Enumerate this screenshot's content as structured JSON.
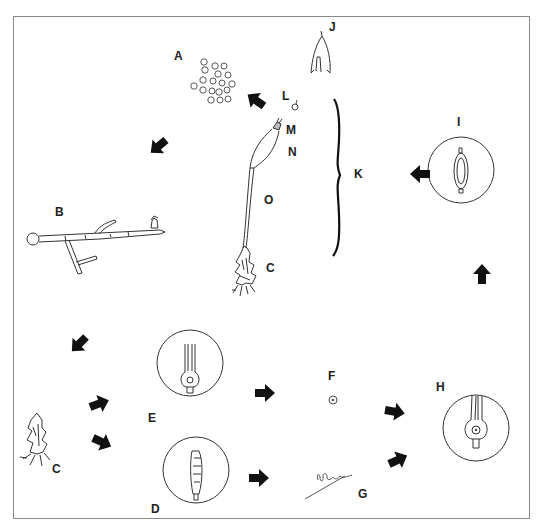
{
  "figure": {
    "labels": {
      "A": "A",
      "B": "B",
      "C_top": "C",
      "C_bottom": "C",
      "D": "D",
      "E": "E",
      "F": "F",
      "G": "G",
      "H": "H",
      "I": "I",
      "J": "J",
      "K": "K",
      "L": "L",
      "M": "M",
      "N": "N",
      "O": "O"
    },
    "stages": [
      {
        "id": "A",
        "depicts": "spores"
      },
      {
        "id": "B",
        "depicts": "protonema with bud"
      },
      {
        "id": "C",
        "depicts": "leafy gametophyte"
      },
      {
        "id": "D",
        "depicts": "antheridium in circle"
      },
      {
        "id": "E",
        "depicts": "archegonium in circle"
      },
      {
        "id": "F",
        "depicts": "egg"
      },
      {
        "id": "G",
        "depicts": "sperm"
      },
      {
        "id": "H",
        "depicts": "fertilization in archegonium"
      },
      {
        "id": "I",
        "depicts": "zygote/embryo in archegonium"
      },
      {
        "id": "J",
        "depicts": "calyptra"
      },
      {
        "id": "K",
        "depicts": "sporophyte (bracket)"
      },
      {
        "id": "L",
        "depicts": "operculum"
      },
      {
        "id": "M",
        "depicts": "peristome"
      },
      {
        "id": "N",
        "depicts": "capsule"
      },
      {
        "id": "O",
        "depicts": "seta"
      }
    ],
    "colors": {
      "line": "#333333",
      "arrow": "#111111",
      "frame": "#8a8a8a"
    }
  }
}
